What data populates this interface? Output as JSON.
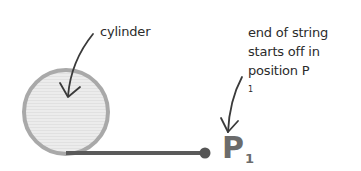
{
  "diagram": {
    "labels": {
      "cylinder": "cylinder",
      "string_end_line1": "end of string",
      "string_end_line2": "starts off in",
      "string_end_line3_prefix": "position P",
      "string_end_line3_sub": "1"
    },
    "point": {
      "letter": "P",
      "subscript": "1"
    },
    "shapes": {
      "cylinder": {
        "cx": 66,
        "cy": 112,
        "r": 43,
        "fill": "#e6e6e6",
        "stroke": "#a9a9a9"
      },
      "string": {
        "x1": 66,
        "y1": 153,
        "x2": 205,
        "y2": 153,
        "color": "#5a5a5a"
      },
      "string_end_dot": {
        "cx": 205,
        "cy": 153,
        "r": 5,
        "color": "#555555"
      }
    },
    "colors": {
      "text": "#2b2b2b",
      "arrow": "#3a3a3a",
      "point_label": "#6b6b6b"
    }
  }
}
